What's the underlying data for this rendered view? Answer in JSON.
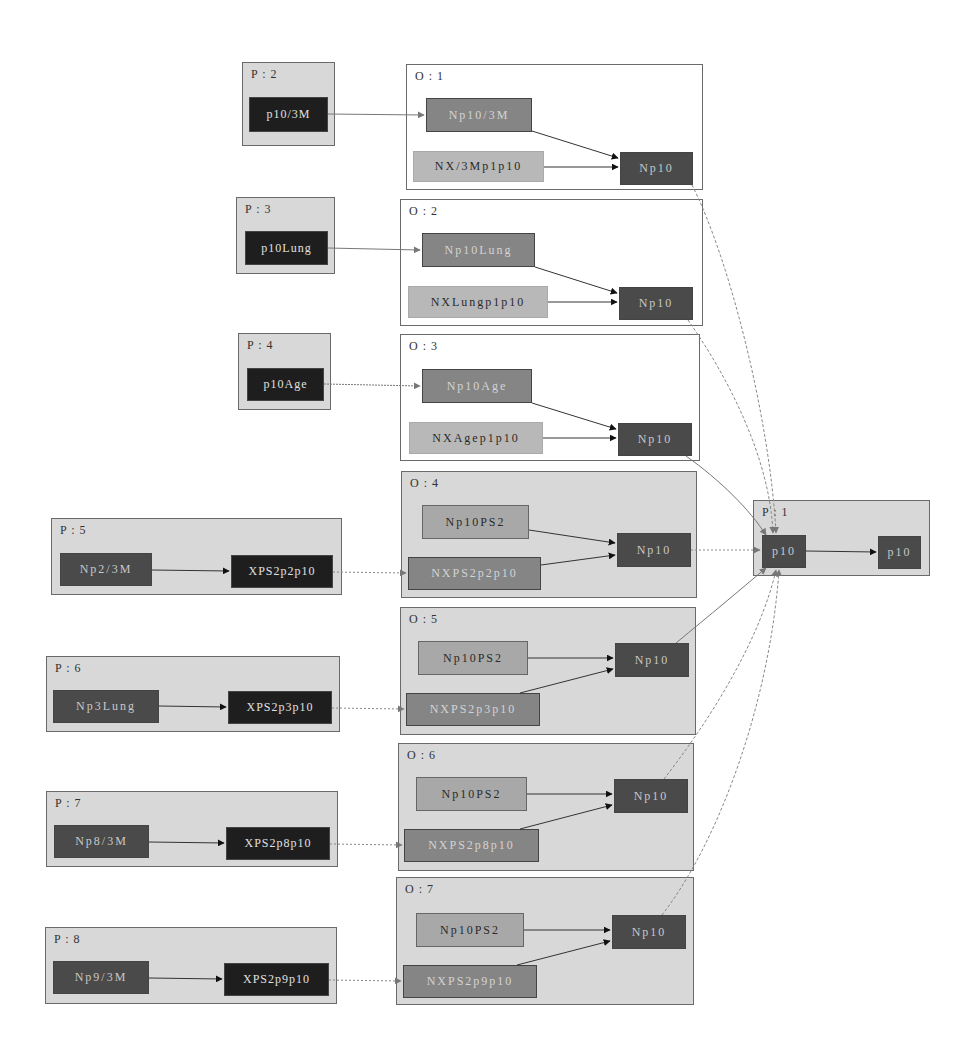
{
  "diagram": {
    "clusters": {
      "P2": {
        "label": "P : 2",
        "nodes": [
          "p10/3M"
        ]
      },
      "P3": {
        "label": "P : 3",
        "nodes": [
          "p10Lung"
        ]
      },
      "P4": {
        "label": "P : 4",
        "nodes": [
          "p10Age"
        ]
      },
      "P5": {
        "label": "P : 5",
        "nodes": [
          "Np2/3M",
          "XPS2p2p10"
        ]
      },
      "P6": {
        "label": "P : 6",
        "nodes": [
          "Np3Lung",
          "XPS2p3p10"
        ]
      },
      "P7": {
        "label": "P : 7",
        "nodes": [
          "Np8/3M",
          "XPS2p8p10"
        ]
      },
      "P8": {
        "label": "P : 8",
        "nodes": [
          "Np9/3M",
          "XPS2p9p10"
        ]
      },
      "O1": {
        "label": "O : 1",
        "nodes": [
          "Np10/3M",
          "NX/3Mp1p10",
          "Np10"
        ]
      },
      "O2": {
        "label": "O : 2",
        "nodes": [
          "Np10Lung",
          "NXLungp1p10",
          "Np10"
        ]
      },
      "O3": {
        "label": "O : 3",
        "nodes": [
          "Np10Age",
          "NXAgep1p10",
          "Np10"
        ]
      },
      "O4": {
        "label": "O : 4",
        "nodes": [
          "Np10PS2",
          "NXPS2p2p10",
          "Np10"
        ]
      },
      "O5": {
        "label": "O : 5",
        "nodes": [
          "Np10PS2",
          "NXPS2p3p10",
          "Np10"
        ]
      },
      "O6": {
        "label": "O : 6",
        "nodes": [
          "Np10PS2",
          "NXPS2p8p10",
          "Np10"
        ]
      },
      "O7": {
        "label": "O : 7",
        "nodes": [
          "Np10PS2",
          "NXPS2p9p10",
          "Np10"
        ]
      },
      "P1": {
        "label": "P : 1",
        "nodes": [
          "p10",
          "p10"
        ]
      }
    }
  }
}
